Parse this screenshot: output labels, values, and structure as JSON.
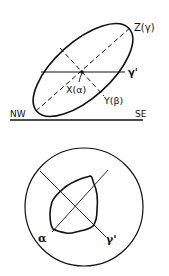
{
  "top_figure": {
    "axis_z_label": "Z(γ)",
    "gamma_prime_label": "γ'",
    "axis_x_label": "X(α)",
    "axis_y_label": "Y(β)",
    "left_direction": "NW",
    "right_direction": "SE"
  },
  "bottom_figure": {
    "alpha_label": "α",
    "gamma_prime_label": "γ'"
  },
  "colors": {
    "stroke": "#111111",
    "background": "#ffffff"
  }
}
